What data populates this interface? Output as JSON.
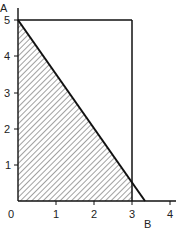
{
  "diagram": {
    "type": "feasible-region",
    "x_axis_label": "B",
    "y_axis_label": "A",
    "x_ticks": [
      "0",
      "1",
      "2",
      "3",
      "4"
    ],
    "y_ticks": [
      "1",
      "2",
      "3",
      "4",
      "5"
    ],
    "lines": [
      {
        "name": "budget-line",
        "from": [
          0,
          5
        ],
        "to": [
          3.33,
          0
        ]
      },
      {
        "name": "constraint-top",
        "at_A": 5,
        "from_B": 0,
        "to_B": 3
      },
      {
        "name": "constraint-right",
        "at_B": 3,
        "from_A": 5,
        "to_A": 0
      }
    ],
    "shaded_region": "area under budget line, B ≤ 3",
    "colors": {
      "line": "#111111",
      "hatch": "#444444",
      "background": "#ffffff"
    }
  }
}
